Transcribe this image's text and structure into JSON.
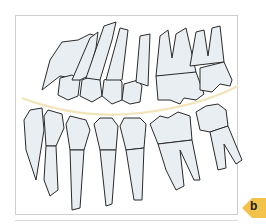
{
  "figure": {
    "panel_label": "b",
    "colors": {
      "tooth_fill": "#e9eef3",
      "tooth_outline": "#2a2a2a",
      "occlusal_curve": "#f2e3b8",
      "badge": "#f3c24a",
      "frame_border": "#cfcfcf"
    },
    "upper_teeth_count": 7,
    "lower_teeth_count": 7
  }
}
